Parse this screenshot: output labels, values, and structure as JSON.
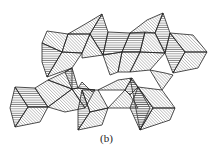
{
  "figure": {
    "caption": "(b)",
    "colors": {
      "stroke": "#222222",
      "hatch": "#555555",
      "background": "#ffffff"
    },
    "faces": [
      {
        "h": "d",
        "pts": "47,31 68,34 62,52 42,43"
      },
      {
        "h": "h",
        "pts": "42,43 62,52 47,77 42,62"
      },
      {
        "h": "d",
        "pts": "62,52 82,53 72,68 47,77"
      },
      {
        "h": "d",
        "pts": "68,34 87,23 102,14 90,34"
      },
      {
        "h": "h",
        "pts": "102,14 108,32 103,55 90,34"
      },
      {
        "h": "d",
        "pts": "68,34 90,34 82,53 62,52"
      },
      {
        "h": "d",
        "pts": "90,34 103,55 82,58 82,53"
      },
      {
        "h": "h",
        "pts": "108,32 130,33 122,52 103,55"
      },
      {
        "h": "d",
        "pts": "103,55 122,52 118,72 110,75"
      },
      {
        "h": "d",
        "pts": "122,52 140,52 130,72 118,72"
      },
      {
        "h": "h",
        "pts": "130,33 145,32 140,52 122,52"
      },
      {
        "h": "d",
        "pts": "145,32 155,33 165,53 140,52"
      },
      {
        "h": "d",
        "pts": "140,52 165,53 150,70 130,72"
      },
      {
        "h": "d",
        "pts": "130,33 147,20 163,13 155,33"
      },
      {
        "h": "h",
        "pts": "163,13 170,33 165,53 155,33"
      },
      {
        "h": "h",
        "pts": "170,33 185,52 173,73 165,53"
      },
      {
        "h": "d",
        "pts": "170,33 193,35 207,52 185,52"
      },
      {
        "h": "d",
        "pts": "185,52 207,52 198,68 173,73"
      },
      {
        "h": "d",
        "pts": "48,80 65,72 72,68 72,89"
      },
      {
        "h": "d",
        "pts": "35,88 48,80 72,89 48,107"
      },
      {
        "h": "h",
        "pts": "15,87 35,88 48,107 28,107"
      },
      {
        "h": "h",
        "pts": "15,87 28,107 15,127 10,108"
      },
      {
        "h": "d",
        "pts": "28,107 48,107 40,122 15,127"
      },
      {
        "h": "h",
        "pts": "65,72 72,68 78,88 72,89"
      },
      {
        "h": "d",
        "pts": "72,89 78,88 95,90 85,108"
      },
      {
        "h": "d",
        "pts": "48,107 72,89 85,108 65,112"
      },
      {
        "h": "h",
        "pts": "78,88 82,82 92,92 95,90"
      },
      {
        "h": "h",
        "pts": "78,110 82,90 90,112 78,130"
      },
      {
        "h": "d",
        "pts": "82,90 98,90 108,108 90,112"
      },
      {
        "h": "d",
        "pts": "90,112 108,108 102,125 78,130"
      },
      {
        "h": "d",
        "pts": "98,90 118,80 132,78 125,90"
      },
      {
        "h": "h",
        "pts": "125,90 132,78 138,87 130,95"
      },
      {
        "h": "d",
        "pts": "108,108 125,90 130,95 138,108"
      },
      {
        "h": "h",
        "pts": "130,78 138,87 150,108 140,130"
      },
      {
        "h": "h",
        "pts": "138,87 153,108 140,130 130,108"
      },
      {
        "h": "d",
        "pts": "138,87 162,90 175,108 153,108"
      },
      {
        "h": "d",
        "pts": "153,108 175,108 170,120 140,130"
      },
      {
        "h": "d",
        "pts": "162,90 173,75 165,73 150,70"
      }
    ]
  }
}
